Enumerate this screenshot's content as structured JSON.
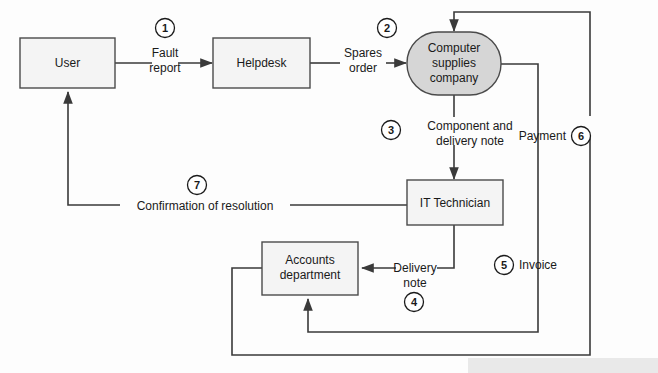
{
  "diagram": {
    "background_color": "#fdfdfd",
    "line_color": "#3a3a3a",
    "box_fill": "#f4f4f4",
    "ellipse_fill": "#d6d6d6",
    "nodes": [
      {
        "id": "user",
        "label_line1": "User",
        "label_line2": "",
        "shape": "rect"
      },
      {
        "id": "helpdesk",
        "label_line1": "Helpdesk",
        "label_line2": "",
        "shape": "rect"
      },
      {
        "id": "supplier",
        "label_line1": "Computer",
        "label_line2": "supplies",
        "label_line3": "company",
        "shape": "stadium"
      },
      {
        "id": "technician",
        "label_line1": "IT Technician",
        "label_line2": "",
        "shape": "rect"
      },
      {
        "id": "accounts",
        "label_line1": "Accounts",
        "label_line2": "department",
        "shape": "rect"
      }
    ],
    "edges": [
      {
        "id": "e1",
        "number": "1",
        "label_line1": "Fault",
        "label_line2": "report",
        "from": "user",
        "to": "helpdesk"
      },
      {
        "id": "e2",
        "number": "2",
        "label_line1": "Spares",
        "label_line2": "order",
        "from": "helpdesk",
        "to": "supplier"
      },
      {
        "id": "e3",
        "number": "3",
        "label_line1": "Component and",
        "label_line2": "delivery note",
        "from": "supplier",
        "to": "technician"
      },
      {
        "id": "e4",
        "number": "4",
        "label_line1": "Delivery",
        "label_line2": "note",
        "from": "technician",
        "to": "accounts"
      },
      {
        "id": "e5",
        "number": "5",
        "label_line1": "Invoice",
        "label_line2": "",
        "from": "supplier",
        "to": "accounts"
      },
      {
        "id": "e6",
        "number": "6",
        "label_line1": "Payment",
        "label_line2": "",
        "from": "accounts",
        "to": "supplier"
      },
      {
        "id": "e7",
        "number": "7",
        "label_line1": "Confirmation of resolution",
        "label_line2": "",
        "from": "technician",
        "to": "user"
      }
    ]
  }
}
